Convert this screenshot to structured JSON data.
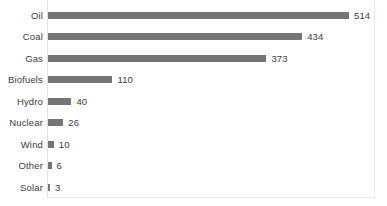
{
  "chart_data": {
    "type": "bar",
    "orientation": "horizontal",
    "title": "",
    "subtitle": "",
    "xlabel": "",
    "ylabel": "",
    "grid": false,
    "legend": false,
    "xlim": [
      0,
      560
    ],
    "categories": [
      "Oil",
      "Coal",
      "Gas",
      "Biofuels",
      "Hydro",
      "Nuclear",
      "Wind",
      "Other",
      "Solar"
    ],
    "values": [
      514,
      434,
      373,
      110,
      40,
      26,
      10,
      6,
      3
    ],
    "value_labels": [
      "514",
      "434",
      "373",
      "110",
      "40",
      "26",
      "10",
      "6",
      "3"
    ],
    "bar_color": "#757575",
    "text_color": "#3b3b3b",
    "background_color": "#ffffff",
    "border_color": "#e8e8e8"
  }
}
